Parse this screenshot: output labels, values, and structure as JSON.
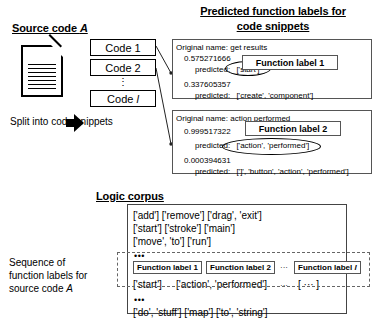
{
  "figure": {
    "source_section": {
      "title": "Source code A",
      "title_plain": "Source code ",
      "title_italic": "A",
      "doc_icon": "document-icon",
      "snippets": [
        {
          "label": "Code 1"
        },
        {
          "label": "Code 2"
        },
        {
          "label": "Code l",
          "label_plain": "Code ",
          "label_italic": "l"
        }
      ],
      "vertical_dots": "⋮",
      "caption": "Split into code snippets"
    },
    "predicted_section": {
      "title_line1": "Predicted function labels for",
      "title_line2": "code snippets",
      "panels": [
        {
          "original_name": "Original name: get results",
          "entries": [
            {
              "score": "0.575271666",
              "predicted": "predicted:",
              "labels": "['start']",
              "highlighted": true
            },
            {
              "score": "0.337605357",
              "predicted": "predicted:",
              "labels": "['create', 'component']",
              "highlighted": false
            }
          ],
          "callout": "Function label 1"
        },
        {
          "original_name": "Original name: action performed",
          "entries": [
            {
              "score": "0.999517322",
              "predicted": "predicted:",
              "labels": "['action', 'performed']",
              "highlighted": true
            },
            {
              "score": "0.000394631",
              "predicted": "predicted:",
              "labels": "[']', 'button', 'action', 'performed']",
              "highlighted": false
            }
          ],
          "callout": "Function label 2"
        }
      ]
    },
    "logic_corpus": {
      "title": "Logic corpus",
      "lines_top": [
        "['add'] ['remove'] ['drag', 'exit']",
        "['start'] ['stroke'] ['main']",
        "['move', 'to'] ['run']"
      ],
      "dots_before_sequence": "•••",
      "sequence": {
        "side_caption_line1": "Sequence of",
        "side_caption_line2": "function labels for",
        "side_caption_line3": "source code A",
        "side_caption_line3_plain": "source code ",
        "side_caption_line3_italic": "A",
        "labels": [
          {
            "text": "Function label 1"
          },
          {
            "text": "Function label 2"
          },
          {
            "text": "Function label l",
            "text_plain": "Function label ",
            "text_italic": "l"
          }
        ],
        "label_separator": "···",
        "values": [
          "['start']",
          "['action', 'performed']"
        ],
        "values_separator": "···",
        "values_last": "[  ···  ]"
      },
      "dots_after_sequence": "•••",
      "lines_bottom": [
        "['do', 'stuff'] ['map'] ['to', 'string']"
      ]
    },
    "colors": {
      "ink": "#000000",
      "panel_border": "#555555",
      "dashed_border": "#666666",
      "background": "#ffffff"
    }
  }
}
